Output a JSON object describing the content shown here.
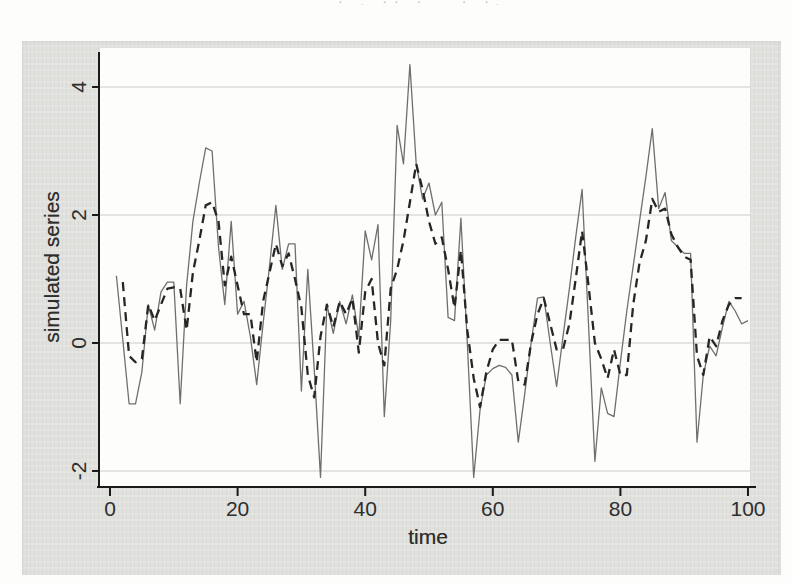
{
  "page": {
    "top_fragment": "· . ·· · ˙ · ·. ·"
  },
  "chart_data": {
    "type": "line",
    "title": "",
    "xlabel": "time",
    "ylabel": "simulated series",
    "xlim": [
      0,
      100
    ],
    "ylim": [
      -2.25,
      4.6
    ],
    "xticks": [
      0,
      20,
      40,
      60,
      80,
      100
    ],
    "xtick_labels": [
      "0",
      "20",
      "40",
      "60",
      "80",
      "100"
    ],
    "yticks": [
      -2,
      0,
      2,
      4
    ],
    "ytick_labels": [
      "-2",
      "0",
      "2",
      "4"
    ],
    "grid": "horizontal",
    "legend": "none",
    "colors": {
      "axis": "#1a1a1a",
      "gridline": "#cbcbc9",
      "solid_series": "#6f6f6f",
      "dashed_series": "#262626",
      "panel_bg": "#e4e4e1",
      "plot_bg": "#fdfdfb"
    },
    "series": [
      {
        "name": "solid-series",
        "style": "solid",
        "color": "#6f6f6f",
        "width": 1.3,
        "start_t": 1,
        "values": [
          1.05,
          0.05,
          -0.95,
          -0.95,
          -0.45,
          0.6,
          0.2,
          0.8,
          0.95,
          0.95,
          -0.95,
          0.9,
          1.9,
          2.5,
          3.05,
          3.0,
          1.5,
          0.6,
          1.9,
          0.45,
          0.65,
          0.1,
          -0.65,
          0.3,
          1.2,
          2.15,
          1.15,
          1.55,
          1.55,
          -0.75,
          1.15,
          -0.4,
          -2.1,
          0.6,
          0.15,
          0.65,
          0.3,
          0.75,
          0.1,
          1.75,
          1.3,
          1.85,
          -1.15,
          0.35,
          3.4,
          2.8,
          4.35,
          2.8,
          2.25,
          2.5,
          2.0,
          2.2,
          0.4,
          0.35,
          1.95,
          0.0,
          -2.1,
          -1.05,
          -0.5,
          -0.4,
          -0.35,
          -0.38,
          -0.5,
          -1.55,
          -0.8,
          0.0,
          0.7,
          0.72,
          0.0,
          -0.68,
          0.1,
          0.85,
          1.65,
          2.4,
          0.3,
          -1.85,
          -0.7,
          -1.1,
          -1.15,
          -0.3,
          0.5,
          1.2,
          1.9,
          2.6,
          3.35,
          2.1,
          2.35,
          1.6,
          1.5,
          1.4,
          1.4,
          -1.55,
          -0.5,
          -0.05,
          -0.2,
          0.25,
          0.65,
          0.5,
          0.3,
          0.35
        ]
      },
      {
        "name": "dashed-series",
        "style": "dashed",
        "color": "#262626",
        "width": 2.3,
        "dash": [
          9,
          6
        ],
        "start_t": 2,
        "values": [
          0.95,
          -0.2,
          -0.3,
          -0.25,
          0.6,
          0.35,
          0.6,
          0.85,
          0.87,
          0.85,
          0.2,
          1.1,
          1.6,
          2.15,
          2.2,
          1.9,
          0.9,
          1.35,
          0.9,
          0.45,
          0.45,
          -0.3,
          0.65,
          1.1,
          1.55,
          1.2,
          1.4,
          1.0,
          0.55,
          -0.5,
          -0.85,
          0.1,
          0.6,
          0.25,
          0.65,
          0.45,
          0.7,
          -0.15,
          0.8,
          1.0,
          0.0,
          -0.35,
          0.85,
          1.15,
          1.6,
          2.2,
          2.8,
          2.4,
          1.9,
          1.55,
          1.65,
          1.15,
          0.55,
          1.45,
          0.2,
          -0.55,
          -1.0,
          -0.45,
          -0.1,
          0.05,
          0.05,
          0.05,
          -0.6,
          -0.65,
          0.0,
          0.45,
          0.7,
          0.3,
          -0.1,
          -0.1,
          0.3,
          1.0,
          1.75,
          0.9,
          0.0,
          -0.25,
          -0.55,
          -0.1,
          -0.5,
          -0.5,
          0.6,
          1.25,
          1.6,
          2.25,
          2.05,
          2.1,
          1.7,
          1.5,
          1.35,
          1.3,
          -0.2,
          -0.5,
          0.1,
          -0.05,
          0.35,
          0.6,
          0.7,
          0.7
        ]
      }
    ]
  }
}
